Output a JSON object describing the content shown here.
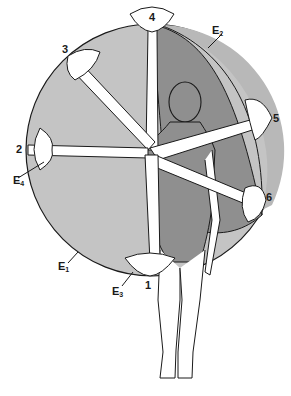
{
  "diagram": {
    "colors": {
      "outer_circle_fill": "#c4c4c4",
      "inner_region_fill": "#8f8f8f",
      "e2_band_fill": "#b5b5b5",
      "body_fill": "#ffffff",
      "line": "#1a1a1a",
      "background": "#ffffff"
    },
    "position_labels": [
      {
        "id": "1",
        "text": "1"
      },
      {
        "id": "2",
        "text": "2"
      },
      {
        "id": "3",
        "text": "3"
      },
      {
        "id": "4",
        "text": "4"
      },
      {
        "id": "5",
        "text": "5"
      },
      {
        "id": "6",
        "text": "6"
      }
    ],
    "envelope_labels": [
      {
        "id": "E1",
        "letter": "E",
        "sub": "1"
      },
      {
        "id": "E2",
        "letter": "E",
        "sub": "2"
      },
      {
        "id": "E3",
        "letter": "E",
        "sub": "3"
      },
      {
        "id": "E4",
        "letter": "E",
        "sub": "4"
      }
    ]
  }
}
